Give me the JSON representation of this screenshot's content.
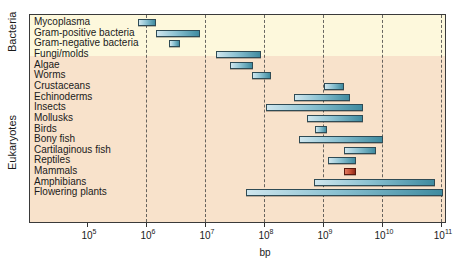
{
  "chart_data": {
    "type": "bar",
    "subtype": "horizontal-range",
    "title": "",
    "xlabel": "bp",
    "ylabel": "",
    "xscale": "log",
    "xlim_log10": [
      4.0,
      11.1
    ],
    "grid": "vertical dashed lines at each decade",
    "legend": null,
    "x_ticks": [
      {
        "base": "10",
        "exp": "5",
        "log10": 5
      },
      {
        "base": "10",
        "exp": "6",
        "log10": 6
      },
      {
        "base": "10",
        "exp": "7",
        "log10": 7
      },
      {
        "base": "10",
        "exp": "8",
        "log10": 8
      },
      {
        "base": "10",
        "exp": "9",
        "log10": 9
      },
      {
        "base": "10",
        "exp": "10",
        "log10": 10
      },
      {
        "base": "10",
        "exp": "11",
        "log10": 11
      }
    ],
    "groups": [
      {
        "name": "Bacteria",
        "rows": [
          0,
          2
        ]
      },
      {
        "name": "Eukaryotes",
        "rows": [
          3,
          16
        ]
      }
    ],
    "categories": [
      "Mycoplasma",
      "Gram-positive bacteria",
      "Gram-negative bacteria",
      "Fungi/molds",
      "Algae",
      "Worms",
      "Crustaceans",
      "Echinoderms",
      "Insects",
      "Mollusks",
      "Birds",
      "Bony fish",
      "Cartilaginous fish",
      "Reptiles",
      "Mammals",
      "Amphibians",
      "Flowering plants"
    ],
    "series": [
      {
        "name": "Genome size range (log10 bp)",
        "values": [
          {
            "category": "Mycoplasma",
            "min_log10": 5.88,
            "max_log10": 6.17
          },
          {
            "category": "Gram-positive bacteria",
            "min_log10": 6.17,
            "max_log10": 6.92
          },
          {
            "category": "Gram-negative bacteria",
            "min_log10": 6.39,
            "max_log10": 6.59
          },
          {
            "category": "Fungi/molds",
            "min_log10": 7.19,
            "max_log10": 7.95
          },
          {
            "category": "Algae",
            "min_log10": 7.44,
            "max_log10": 7.83
          },
          {
            "category": "Worms",
            "min_log10": 7.81,
            "max_log10": 8.12
          },
          {
            "category": "Crustaceans",
            "min_log10": 9.02,
            "max_log10": 9.36
          },
          {
            "category": "Echinoderms",
            "min_log10": 8.51,
            "max_log10": 9.47
          },
          {
            "category": "Insects",
            "min_log10": 8.05,
            "max_log10": 9.69
          },
          {
            "category": "Mollusks",
            "min_log10": 8.73,
            "max_log10": 9.69
          },
          {
            "category": "Birds",
            "min_log10": 8.88,
            "max_log10": 9.08
          },
          {
            "category": "Bony fish",
            "min_log10": 8.61,
            "max_log10": 10.02
          },
          {
            "category": "Cartilaginous fish",
            "min_log10": 9.36,
            "max_log10": 9.9
          },
          {
            "category": "Reptiles",
            "min_log10": 9.1,
            "max_log10": 9.56
          },
          {
            "category": "Mammals",
            "min_log10": 9.37,
            "max_log10": 9.56,
            "highlight": true
          },
          {
            "category": "Amphibians",
            "min_log10": 8.86,
            "max_log10": 10.9
          },
          {
            "category": "Flowering plants",
            "min_log10": 7.71,
            "max_log10": 11.05
          }
        ]
      }
    ],
    "colors": {
      "bar": "#6aaabd",
      "bar_highlight": "#b8442c",
      "band_bacteria": "#fdf8dc",
      "band_eukaryotes": "#f8e2cb"
    }
  }
}
